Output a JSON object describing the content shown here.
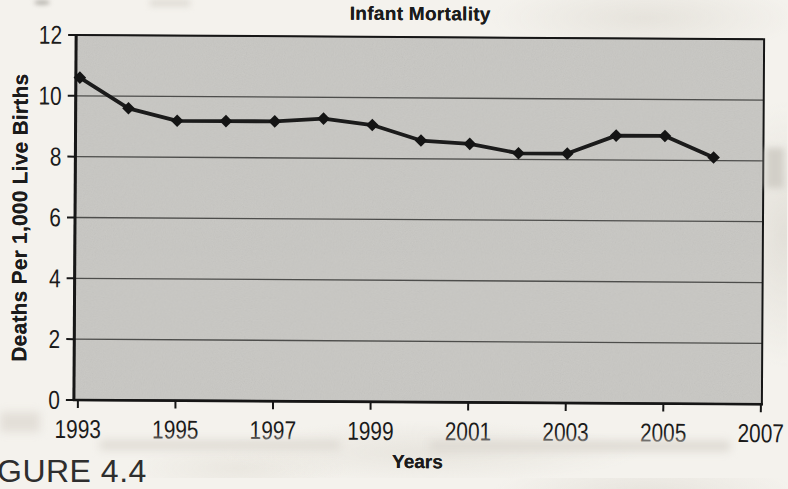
{
  "figure": {
    "caption": "GURE 4.4"
  },
  "chart_data": {
    "type": "line",
    "title": "Infant Mortality",
    "xlabel": "Years",
    "ylabel": "Deaths Per 1,000 Live Births",
    "x": [
      1993,
      1994,
      1995,
      1996,
      1997,
      1998,
      1999,
      2000,
      2001,
      2002,
      2003,
      2004,
      2005,
      2006
    ],
    "values": [
      10.6,
      9.6,
      9.2,
      9.2,
      9.2,
      9.3,
      9.1,
      8.6,
      8.5,
      8.2,
      8.2,
      8.8,
      8.8,
      8.1
    ],
    "series": [
      {
        "name": "Infant mortality rate",
        "values": [
          10.6,
          9.6,
          9.2,
          9.2,
          9.2,
          9.3,
          9.1,
          8.6,
          8.5,
          8.2,
          8.2,
          8.8,
          8.8,
          8.1
        ]
      }
    ],
    "xlim": [
      1993,
      2007
    ],
    "ylim": [
      0,
      12
    ],
    "xticks": [
      1993,
      1995,
      1997,
      1999,
      2001,
      2003,
      2005,
      2007
    ],
    "yticks": [
      0,
      2,
      4,
      6,
      8,
      10,
      12
    ],
    "grid": true,
    "legend_position": "none",
    "marker": "diamond",
    "colors": {
      "line": "#1b1b1b",
      "marker": "#141414",
      "plot_bg": "#c8c7c3",
      "grid": "#4d4d4b",
      "axis": "#161616",
      "text": "#1b1b1b",
      "page_bg": "#f4f2ed"
    }
  }
}
